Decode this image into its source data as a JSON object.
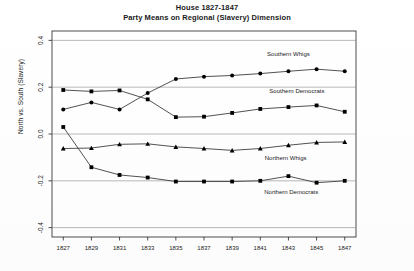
{
  "chart_data": {
    "type": "line",
    "title": "House 1827-1847",
    "subtitle": "Party Means on Regional (Slavery) Dimension",
    "xlabel": "",
    "ylabel": "North vs. South (Slavery)",
    "x": [
      1827,
      1829,
      1831,
      1833,
      1835,
      1837,
      1839,
      1841,
      1843,
      1845,
      1847
    ],
    "xtick_labels": [
      "1827",
      "1829",
      "1831",
      "1833",
      "1835",
      "1837",
      "1839",
      "1841",
      "1843",
      "1845",
      "1847"
    ],
    "ytick_labels": [
      "0.4",
      "0.2",
      "0.0",
      "-0.2",
      "-0.4"
    ],
    "ytick_values": [
      0.4,
      0.2,
      0.0,
      -0.2,
      -0.4
    ],
    "ylim": [
      -0.44,
      0.44
    ],
    "xlim": [
      1826.2,
      1847.8
    ],
    "grid": false,
    "legend_position": "inline-right",
    "series": [
      {
        "name": "Southern Whigs",
        "marker": "circle",
        "label_x": 1843.0,
        "label_y": 0.335,
        "values": [
          0.105,
          0.135,
          0.105,
          0.175,
          0.235,
          0.245,
          0.25,
          0.258,
          0.268,
          0.277,
          0.268
        ]
      },
      {
        "name": "Southern Democrats",
        "marker": "square",
        "label_x": 1843.6,
        "label_y": 0.175,
        "values": [
          0.188,
          0.182,
          0.186,
          0.148,
          0.072,
          0.074,
          0.09,
          0.107,
          0.115,
          0.122,
          0.095
        ]
      },
      {
        "name": "Northern Whigs",
        "marker": "triangle",
        "label_x": 1842.8,
        "label_y": -0.11,
        "values": [
          -0.062,
          -0.06,
          -0.044,
          -0.042,
          -0.055,
          -0.062,
          -0.07,
          -0.062,
          -0.048,
          -0.036,
          -0.034
        ]
      },
      {
        "name": "Northern Democrats",
        "marker": "square",
        "label_x": 1843.2,
        "label_y": -0.258,
        "values": [
          0.03,
          -0.142,
          -0.175,
          -0.186,
          -0.203,
          -0.203,
          -0.203,
          -0.2,
          -0.18,
          -0.208,
          -0.2
        ]
      }
    ],
    "colors": {
      "line": "#333333",
      "marker": "#000000",
      "axis": "#222222",
      "background": "#ffffff"
    }
  },
  "caption": {
    "text": ""
  }
}
